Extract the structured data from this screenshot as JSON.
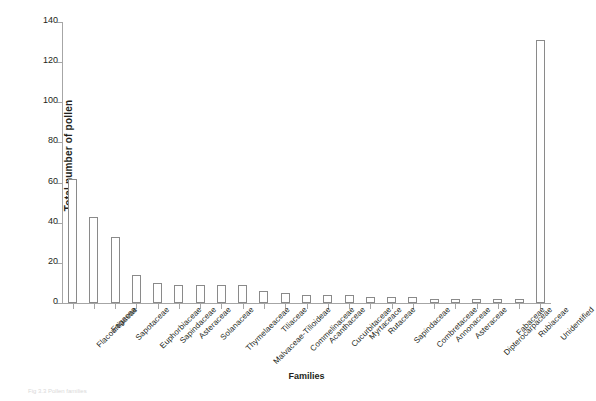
{
  "figure": {
    "caption_fragment": "Fig 3.3 Pollen families"
  },
  "chart_data": {
    "type": "bar",
    "title": "",
    "xlabel": "Families",
    "ylabel": "Total number of pollen",
    "ylim": [
      0,
      140
    ],
    "ytick_step": 20,
    "yticks": [
      0,
      20,
      40,
      60,
      80,
      100,
      120,
      140
    ],
    "grid": false,
    "legend": null,
    "bar_style": {
      "fill": "#ffffff",
      "edge": "#8a8a8a"
    },
    "categories": [
      "Flacourtiaceae",
      "Fagacea",
      "Sapotaceae",
      "Euphorbiaceae",
      "Sapindaceae",
      "Asteraceae",
      "Solanaceae",
      "Thymelaeaceae",
      "Malvaceae-Tilioideae",
      "Tiliaceae",
      "Commelinaceae",
      "Acanthaceae",
      "Cucurbitaceae",
      "Myrtaceace",
      "Rutaceae",
      "Sapindaceae",
      "Combretaceae",
      "Annonaceae",
      "Asteraceae",
      "Dipterocarpaceae",
      "Fabaceae",
      "Rubiaceae",
      "Unidentified"
    ],
    "values": [
      62,
      43,
      33,
      14,
      10,
      9,
      9,
      9,
      9,
      6,
      5,
      4,
      4,
      4,
      3,
      3,
      3,
      2,
      2,
      2,
      2,
      2,
      131
    ]
  }
}
